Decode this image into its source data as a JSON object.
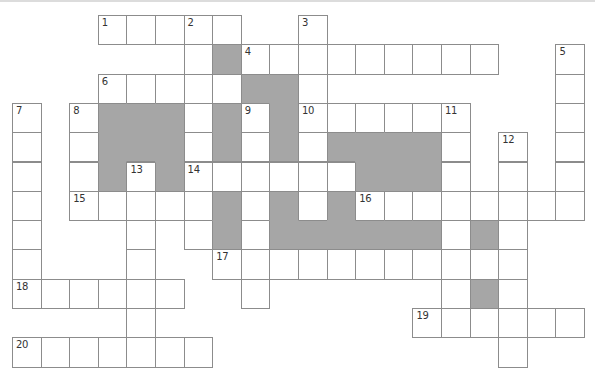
{
  "puzzle": {
    "type": "crossword",
    "cols": 20,
    "rows": 12,
    "legend": {
      ".": "empty",
      "W": "white-cell",
      "G": "shaded-cell"
    },
    "layout": [
      "...WWWWW..W.........",
      "......WGWWWWWWWWW..W",
      "...WWWWWGGW........W",
      "W.WGGGWGWGWWWWWW...W",
      "W.WGGGWGWGWGGGGW.W.W",
      "W.WGWGWWWWWWGGGW.W.W",
      "W.WWWWWGWGWGWWWWWWWW",
      "W...W.WGWGGGGGGWGW..",
      "W...W..WWWWWWWWWWW..",
      "WWWWWW..W......WGW..",
      "....W.........WWWWWW",
      "WWWWWWW..........W.."
    ],
    "numbers": [
      {
        "n": "1",
        "row": 0,
        "col": 3
      },
      {
        "n": "2",
        "row": 0,
        "col": 6
      },
      {
        "n": "3",
        "row": 0,
        "col": 10
      },
      {
        "n": "4",
        "row": 1,
        "col": 8
      },
      {
        "n": "5",
        "row": 1,
        "col": 19
      },
      {
        "n": "6",
        "row": 2,
        "col": 3
      },
      {
        "n": "7",
        "row": 3,
        "col": 0
      },
      {
        "n": "8",
        "row": 3,
        "col": 2
      },
      {
        "n": "9",
        "row": 3,
        "col": 8
      },
      {
        "n": "10",
        "row": 3,
        "col": 10
      },
      {
        "n": "11",
        "row": 3,
        "col": 15
      },
      {
        "n": "12",
        "row": 4,
        "col": 17
      },
      {
        "n": "13",
        "row": 5,
        "col": 4
      },
      {
        "n": "14",
        "row": 5,
        "col": 6
      },
      {
        "n": "15",
        "row": 6,
        "col": 2
      },
      {
        "n": "16",
        "row": 6,
        "col": 12
      },
      {
        "n": "17",
        "row": 8,
        "col": 7
      },
      {
        "n": "18",
        "row": 9,
        "col": 0
      },
      {
        "n": "19",
        "row": 10,
        "col": 14
      },
      {
        "n": "20",
        "row": 11,
        "col": 0
      }
    ],
    "colors": {
      "cell_border": "#8c8c8c",
      "shaded": "#a6a6a6",
      "cell_bg": "#ffffff",
      "number_text": "#333333"
    }
  }
}
